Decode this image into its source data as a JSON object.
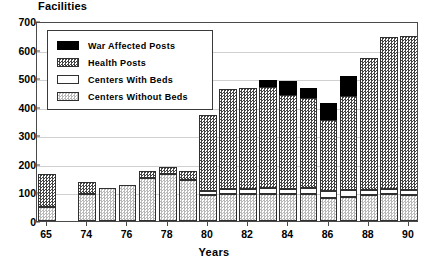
{
  "chart_data": {
    "type": "bar",
    "title": "Facilities",
    "xlabel": "Years",
    "ylabel": "Facilities",
    "stacked": true,
    "grid": true,
    "legend_position": "inside-top-left",
    "ylim": [
      0,
      700
    ],
    "ytick_values": [
      0,
      100,
      200,
      300,
      400,
      500,
      600,
      700
    ],
    "ytick_labels": [
      "0",
      "100",
      "200",
      "300",
      "400",
      "500",
      "600",
      "700"
    ],
    "categories": [
      "65",
      "73",
      "74",
      "75",
      "76",
      "77",
      "78",
      "79",
      "80",
      "81",
      "82",
      "83",
      "84",
      "85",
      "86",
      "87",
      "88",
      "89",
      "90"
    ],
    "xtick_labels": [
      "65",
      "74",
      "76",
      "78",
      "80",
      "82",
      "84",
      "86",
      "88",
      "90"
    ],
    "xtick_categories": [
      "65",
      "74",
      "76",
      "78",
      "80",
      "82",
      "84",
      "86",
      "88",
      "90"
    ],
    "series": [
      {
        "name": "Centers Without Beds",
        "color": "#d9d9d9",
        "pattern": "light-stipple",
        "values": [
          48,
          0,
          95,
          117,
          126,
          152,
          166,
          143,
          92,
          95,
          95,
          96,
          95,
          96,
          82,
          85,
          92,
          93,
          90
        ]
      },
      {
        "name": "Centers With Beds",
        "color": "#ffffff",
        "pattern": "solid-white",
        "values": [
          0,
          0,
          0,
          0,
          0,
          0,
          0,
          0,
          14,
          18,
          18,
          18,
          18,
          18,
          24,
          22,
          18,
          18,
          18
        ]
      },
      {
        "name": "Health Posts",
        "color": "#555555",
        "pattern": "dark-checker",
        "values": [
          117,
          0,
          40,
          0,
          0,
          22,
          22,
          32,
          266,
          348,
          353,
          356,
          328,
          315,
          247,
          330,
          462,
          532,
          538
        ]
      },
      {
        "name": "War Affected Posts",
        "color": "#000000",
        "pattern": "solid-black",
        "values": [
          0,
          0,
          0,
          0,
          0,
          0,
          0,
          0,
          0,
          0,
          0,
          23,
          50,
          38,
          60,
          72,
          0,
          0,
          0
        ]
      }
    ],
    "totals": [
      165,
      0,
      135,
      117,
      126,
      174,
      188,
      175,
      372,
      461,
      466,
      493,
      491,
      467,
      413,
      509,
      572,
      643,
      646
    ],
    "annotations": []
  },
  "legend": {
    "items": [
      {
        "label": "War Affected Posts",
        "swatch": "solid-black"
      },
      {
        "label": "Health Posts",
        "swatch": "dark-checker"
      },
      {
        "label": "Centers With Beds",
        "swatch": "solid-white"
      },
      {
        "label": "Centers Without Beds",
        "swatch": "light-stipple"
      }
    ]
  }
}
